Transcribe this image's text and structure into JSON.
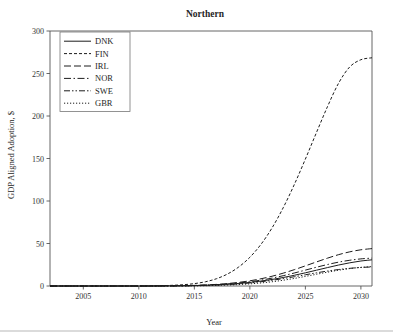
{
  "chart_data": {
    "type": "line",
    "title": "Northern",
    "xlabel": "Year",
    "ylabel": "GDP Aligned Adoption, $",
    "xlim": [
      2002,
      2031
    ],
    "ylim": [
      0,
      300
    ],
    "xticks": [
      2005,
      2010,
      2015,
      2020,
      2025,
      2030
    ],
    "xtick_labels": [
      "2005",
      "2010",
      "2015",
      "2020",
      "2025",
      "2030"
    ],
    "yticks": [
      0,
      50,
      100,
      150,
      200,
      250,
      300
    ],
    "ytick_labels": [
      "0",
      "50",
      "100",
      "150",
      "200",
      "250",
      "300"
    ],
    "grid": false,
    "legend_position": "upper left",
    "x": [
      2002,
      2003,
      2004,
      2005,
      2006,
      2007,
      2008,
      2009,
      2010,
      2011,
      2012,
      2013,
      2014,
      2015,
      2016,
      2017,
      2018,
      2019,
      2020,
      2021,
      2022,
      2023,
      2024,
      2025,
      2026,
      2027,
      2028,
      2029,
      2030,
      2031
    ],
    "series": [
      {
        "name": "DNK",
        "style": "solid",
        "dasharray": "",
        "values": [
          0,
          0,
          0,
          0,
          0,
          0,
          0,
          0,
          0,
          0,
          0.1,
          0.2,
          0.3,
          0.5,
          0.9,
          1.4,
          2.1,
          3.0,
          4.2,
          5.8,
          7.7,
          10.0,
          12.6,
          15.5,
          18.6,
          21.7,
          24.7,
          27.3,
          29.4,
          30.8
        ]
      },
      {
        "name": "FIN",
        "style": "dashed-short",
        "dasharray": "3,2",
        "values": [
          0,
          0,
          0,
          0,
          0,
          0,
          0,
          0,
          0.1,
          0.2,
          0.4,
          0.8,
          1.5,
          2.8,
          5.0,
          8.6,
          14.2,
          22.4,
          33.8,
          49.0,
          68.4,
          92.0,
          119.3,
          149.3,
          180.6,
          211.3,
          238.8,
          257.8,
          266.2,
          268.5
        ]
      },
      {
        "name": "IRL",
        "style": "dashed-long",
        "dasharray": "7,3",
        "values": [
          0,
          0,
          0,
          0,
          0,
          0,
          0,
          0,
          0,
          0,
          0.1,
          0.2,
          0.4,
          0.7,
          1.2,
          1.9,
          2.9,
          4.3,
          6.1,
          8.5,
          11.5,
          15.1,
          19.2,
          23.7,
          28.3,
          32.8,
          36.9,
          40.2,
          42.6,
          44.0
        ]
      },
      {
        "name": "NOR",
        "style": "dash-dot",
        "dasharray": "7,2.5,1.5,2.5",
        "values": [
          0,
          0,
          0,
          0,
          0,
          0,
          0,
          0,
          0,
          0,
          0.1,
          0.2,
          0.3,
          0.6,
          1.0,
          1.6,
          2.4,
          3.5,
          5.0,
          6.9,
          9.3,
          12.1,
          15.3,
          18.7,
          22.1,
          25.3,
          28.1,
          30.3,
          31.9,
          32.8
        ]
      },
      {
        "name": "SWE",
        "style": "dash-dot-dot",
        "dasharray": "6,2,1.5,2,1.5,2",
        "values": [
          0,
          0,
          0,
          0,
          0,
          0,
          0,
          0,
          0,
          0,
          0,
          0.1,
          0.2,
          0.4,
          0.7,
          1.1,
          1.7,
          2.5,
          3.6,
          5.0,
          6.7,
          8.7,
          10.9,
          13.2,
          15.5,
          17.6,
          19.4,
          20.8,
          21.8,
          22.4
        ]
      },
      {
        "name": "GBR",
        "style": "dotted",
        "dasharray": "1.2,1.8",
        "values": [
          0,
          0,
          0,
          0,
          0,
          0,
          0,
          0,
          0,
          0,
          0,
          0,
          0.1,
          0.2,
          0.4,
          0.7,
          1.1,
          1.7,
          2.5,
          3.6,
          5.0,
          6.8,
          8.9,
          11.3,
          13.8,
          16.3,
          18.6,
          20.5,
          21.9,
          22.8
        ]
      }
    ]
  },
  "legend": {
    "entries": [
      {
        "label": "DNK"
      },
      {
        "label": "FIN"
      },
      {
        "label": "IRL"
      },
      {
        "label": "NOR"
      },
      {
        "label": "SWE"
      },
      {
        "label": "GBR"
      }
    ]
  }
}
